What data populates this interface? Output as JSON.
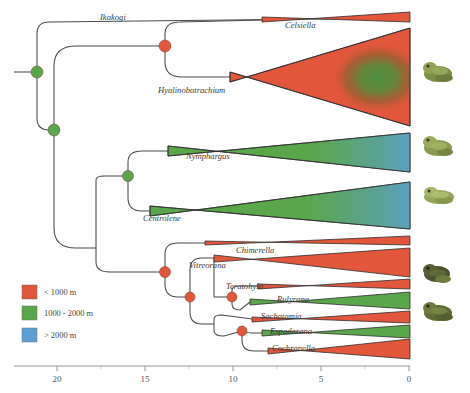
{
  "figure": {
    "type": "phylogenetic-tree"
  },
  "colors": {
    "low": "#e2563c",
    "mid": "#5aa64b",
    "high": "#5b9fd4",
    "node_low": "#e2563c",
    "node_mid": "#5aa64b",
    "branch": "#4a4a4a"
  },
  "legend": {
    "items": [
      {
        "label": "< 1000 m",
        "color": "#e2563c",
        "key": "low"
      },
      {
        "label": "1000 - 2000 m",
        "color": "#5aa64b",
        "key": "mid"
      },
      {
        "label": "> 2000 m",
        "color": "#5b9fd4",
        "key": "high"
      }
    ]
  },
  "axis": {
    "label": "",
    "ticks": [
      20,
      15,
      10,
      5,
      0
    ],
    "tick_labels": [
      "20",
      "15",
      "10",
      "5",
      "0"
    ],
    "minor_ticks": [
      22.5,
      17.5,
      12.5,
      7.5,
      2.5
    ],
    "range": [
      23,
      0
    ],
    "direction": "reversed"
  },
  "taxa": [
    {
      "name": "Ikakogi",
      "y": 22,
      "label_x": 100,
      "label_y": 20,
      "clade": "basal"
    },
    {
      "name": "Celsiella",
      "y": 24,
      "label_x": 285,
      "label_y": 24,
      "clade": "hyalinobatrachinae"
    },
    {
      "name": "Hyalinobatrachium",
      "y": 88,
      "label_x": 160,
      "label_y": 90,
      "clade": "hyalinobatrachinae"
    },
    {
      "name": "Nymphargus",
      "y": 155,
      "label_x": 188,
      "label_y": 157,
      "clade": "centroleninae"
    },
    {
      "name": "Centrolene",
      "y": 210,
      "label_x": 143,
      "label_y": 212,
      "clade": "centroleninae"
    },
    {
      "name": "Chimerella",
      "y": 245,
      "label_x": 240,
      "label_y": 247,
      "clade": "centroleninae"
    },
    {
      "name": "Vitreorana",
      "y": 266,
      "label_x": 190,
      "label_y": 268,
      "clade": "centroleninae"
    },
    {
      "name": "Teratohyla",
      "y": 288,
      "label_x": 228,
      "label_y": 290,
      "clade": "centroleninae"
    },
    {
      "name": "Rulyrana",
      "y": 303,
      "label_x": 278,
      "label_y": 305,
      "clade": "centroleninae"
    },
    {
      "name": "Sachatamia",
      "y": 321,
      "label_x": 262,
      "label_y": 323,
      "clade": "centroleninae"
    },
    {
      "name": "Espadarana",
      "y": 337,
      "label_x": 270,
      "label_y": 339,
      "clade": "centroleninae"
    },
    {
      "name": "Cochranella",
      "y": 354,
      "label_x": 272,
      "label_y": 356,
      "clade": "centroleninae"
    }
  ],
  "nodes": [
    {
      "id": "root",
      "x": 37,
      "y": 72,
      "color": "#5aa64b",
      "r": 6
    },
    {
      "id": "n2",
      "x": 54,
      "y": 130,
      "color": "#5aa64b",
      "r": 6
    },
    {
      "id": "n3",
      "x": 165,
      "y": 46,
      "color": "#e2563c",
      "r": 6
    },
    {
      "id": "n4",
      "x": 128,
      "y": 176,
      "color": "#5aa64b",
      "r": 5.5
    },
    {
      "id": "n5",
      "x": 165,
      "y": 272,
      "color": "#e2563c",
      "r": 5.5
    },
    {
      "id": "n6",
      "x": 190,
      "y": 297,
      "color": "#e2563c",
      "r": 5
    },
    {
      "id": "n7",
      "x": 232,
      "y": 297,
      "color": "#e2563c",
      "r": 5
    },
    {
      "id": "n8",
      "x": 242,
      "y": 331,
      "color": "#e2563c",
      "r": 5
    }
  ],
  "triangles": [
    {
      "taxon": "Celsiella",
      "fill": "low",
      "tip_x": 262,
      "top_y": 16,
      "bot_y": 22,
      "right_x": 410,
      "right_top": 14,
      "right_bot": 22
    },
    {
      "taxon": "Hyalinobatrachium",
      "fill": "low",
      "tip_x": 230,
      "top_y": 72,
      "bot_y": 82,
      "right_x": 410,
      "right_top": 30,
      "right_bot": 125,
      "blob": true
    },
    {
      "taxon": "Nymphargus",
      "fill": "mid",
      "tip_x": 168,
      "top_y": 146,
      "bot_y": 156,
      "right_x": 410,
      "right_top": 133,
      "right_bot": 172,
      "blue_edge": true
    },
    {
      "taxon": "Centrolene",
      "fill": "mid",
      "tip_x": 150,
      "top_y": 206,
      "bot_y": 216,
      "right_x": 410,
      "right_top": 182,
      "right_bot": 229,
      "blue_edge": true
    },
    {
      "taxon": "Chimerella",
      "fill": "low",
      "tip_x": 205,
      "top_y": 240,
      "bot_y": 245,
      "right_x": 410,
      "right_top": 236,
      "right_bot": 244
    },
    {
      "taxon": "Vitreorana",
      "fill": "low",
      "tip_x": 214,
      "top_y": 255,
      "bot_y": 262,
      "right_x": 410,
      "right_top": 248,
      "right_bot": 276
    },
    {
      "taxon": "Teratohyla",
      "fill": "low",
      "tip_x": 258,
      "top_y": 284,
      "bot_y": 289,
      "right_x": 410,
      "right_top": 280,
      "right_bot": 288
    },
    {
      "taxon": "Rulyrana",
      "fill": "mid",
      "tip_x": 250,
      "top_y": 299,
      "bot_y": 305,
      "right_x": 410,
      "right_top": 292,
      "right_bot": 308
    },
    {
      "taxon": "Sachatamia",
      "fill": "low",
      "tip_x": 252,
      "top_y": 316,
      "bot_y": 322,
      "right_x": 410,
      "right_top": 312,
      "right_bot": 322
    },
    {
      "taxon": "Espadarana",
      "fill": "mid",
      "tip_x": 262,
      "top_y": 330,
      "bot_y": 336,
      "right_x": 410,
      "right_top": 326,
      "right_bot": 337
    },
    {
      "taxon": "Cochranella",
      "fill": "low",
      "tip_x": 268,
      "top_y": 348,
      "bot_y": 354,
      "right_x": 410,
      "right_top": 340,
      "right_bot": 358
    }
  ],
  "photos": [
    {
      "name": "frog-photo-1",
      "y": 60,
      "tone": "#8a9a4e"
    },
    {
      "name": "frog-photo-2",
      "y": 134,
      "tone": "#9aa85c"
    },
    {
      "name": "frog-photo-3",
      "y": 184,
      "tone": "#a7b06a"
    },
    {
      "name": "frog-photo-4",
      "y": 262,
      "tone": "#4f5630"
    },
    {
      "name": "frog-photo-5",
      "y": 300,
      "tone": "#6d7a3e"
    }
  ]
}
